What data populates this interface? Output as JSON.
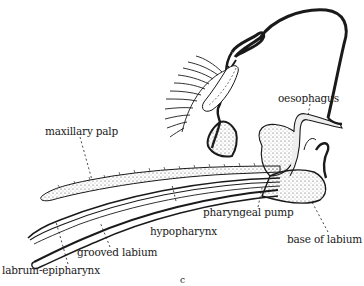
{
  "figure": {
    "type": "anatomical line drawing",
    "caption_fragment": "c",
    "colors": {
      "ink": "#1a1a1a",
      "stipple": "#555555",
      "paper": "#ffffff"
    }
  },
  "labels": {
    "oesophagus": "oesophagus",
    "maxillary_palp": "maxillary palp",
    "pharyngeal_pump": "pharyngeal pump",
    "hypopharynx": "hypopharynx",
    "base_of_labium": "base of labium",
    "grooved_labium": "grooved labium",
    "labrum_epipharynx": "labrum-epipharynx"
  }
}
